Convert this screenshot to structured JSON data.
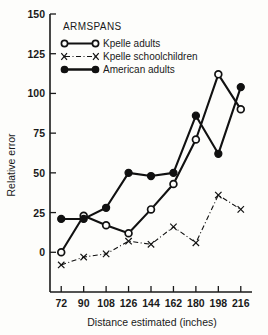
{
  "chart_data": {
    "type": "line",
    "title": "ARMSPANS",
    "xlabel": "Distance estimated (inches)",
    "ylabel": "Relative error",
    "x": [
      72,
      90,
      108,
      126,
      144,
      162,
      180,
      198,
      216
    ],
    "xtick_labels": [
      "72",
      "90",
      "108",
      "126",
      "144",
      "162",
      "180",
      "198",
      "216"
    ],
    "ytick_labels": [
      "0",
      "25",
      "50",
      "75",
      "100",
      "125",
      "150"
    ],
    "yticks": [
      0,
      25,
      50,
      75,
      100,
      125,
      150
    ],
    "xlim": [
      63,
      225
    ],
    "ylim": [
      -25,
      150
    ],
    "grid": false,
    "legend_position": "upper-left-inside",
    "series": [
      {
        "name": "Kpelle adults",
        "marker": "open-circle",
        "linestyle": "solid",
        "values": [
          0,
          23,
          17,
          12,
          27,
          43,
          71,
          112,
          90
        ]
      },
      {
        "name": "Kpelle schoolchildren",
        "marker": "x",
        "linestyle": "dash-dot",
        "values": [
          -8,
          -3,
          -1,
          7,
          5,
          16,
          6,
          36,
          27
        ]
      },
      {
        "name": "American adults",
        "marker": "filled-circle",
        "linestyle": "solid",
        "values": [
          21,
          21,
          28,
          50,
          48,
          50,
          86,
          62,
          104
        ]
      }
    ]
  },
  "legend": {
    "title": "ARMSPANS",
    "entries": [
      {
        "label": "Kpelle adults"
      },
      {
        "label": "Kpelle schoolchildren"
      },
      {
        "label": "American adults"
      }
    ]
  },
  "axes": {
    "y_title": "Relative error",
    "x_title": "Distance estimated (inches)"
  }
}
